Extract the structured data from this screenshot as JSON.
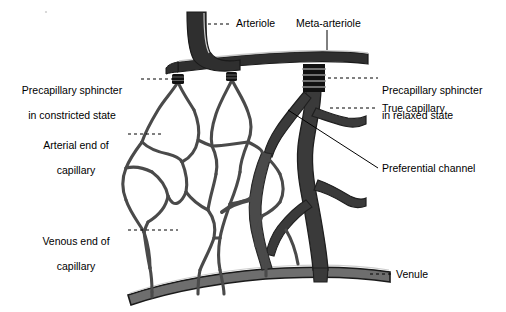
{
  "figure": {
    "background_color": "#ffffff",
    "colors": {
      "vessel_dark": "#2f2f2f",
      "vessel_mid": "#6e6e6e",
      "vessel_outline": "#1a1a1a",
      "capillary_stroke": "#4a4a4a",
      "highlight": "#d8d8d8",
      "leader_line": "#000000",
      "text": "#000000"
    }
  },
  "labels": {
    "arteriole": {
      "text": "Arteriole",
      "leader": "dashed-horizontal"
    },
    "meta_arteriole": {
      "text": "Meta-arteriole",
      "leader": "vertical"
    },
    "sphincter_constricted": {
      "line1": "Precapillary sphincter",
      "line2": "in constricted state",
      "leader": "dashed-horizontal"
    },
    "sphincter_relaxed": {
      "line1": "Precapillary sphincter",
      "line2": "in relaxed state",
      "leader": "dashed-horizontal"
    },
    "arterial_end": {
      "line1": "Arterial end of",
      "line2": "capillary",
      "leader": "dashed-horizontal"
    },
    "venous_end": {
      "line1": "Venous end of",
      "line2": "capillary",
      "leader": "dashed-horizontal"
    },
    "true_capillary": {
      "text": "True capillary",
      "leader": "dashed-horizontal"
    },
    "preferential_channel": {
      "text": "Preferential channel",
      "leader": "diagonal-solid"
    },
    "venule": {
      "text": "Venule",
      "leader": "dashed-horizontal"
    }
  },
  "structures": {
    "arteriole": "arteriole-vessel",
    "meta_arteriole": "meta-arteriole-vessel",
    "venule": "venule-vessel",
    "preferential_channel": "preferential-channel-vessel",
    "true_capillary": "true-capillary-vessel",
    "capillary_network": "capillary-network",
    "sphincter_relaxed_rings": 4,
    "sphincter_constricted_count": 2
  }
}
